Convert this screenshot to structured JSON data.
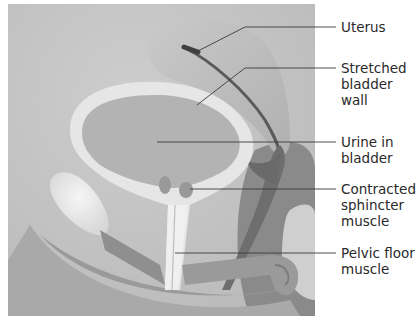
{
  "diagram": {
    "type": "anatomical-illustration",
    "colors": {
      "background": "#c4c4c4",
      "bladder_wall": "#e8e8e8",
      "urine": "#b3b3b3",
      "uterus": "#bdbdbd",
      "dark_tissue": "#6e6e6e",
      "leader_line": "#3a3a3a",
      "label_text": "#2a2a2a"
    },
    "labels": [
      {
        "id": "uterus",
        "text": "Uterus"
      },
      {
        "id": "stretched-bladder-wall",
        "text": "Stretched\nbladder\nwall"
      },
      {
        "id": "urine-in-bladder",
        "text": "Urine in\nbladder"
      },
      {
        "id": "contracted-sphincter-muscle",
        "text": "Contracted\nsphincter\nmuscle"
      },
      {
        "id": "pelvic-floor-muscle",
        "text": "Pelvic floor\nmuscle"
      }
    ]
  }
}
